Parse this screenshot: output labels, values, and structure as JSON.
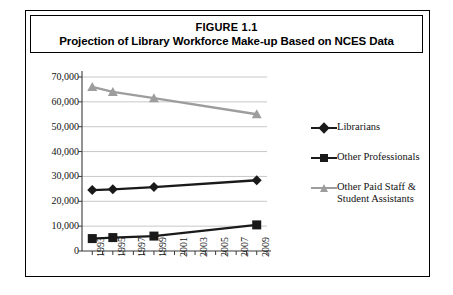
{
  "figure": {
    "title_line1": "FIGURE 1.1",
    "title_line2": "Projection of Library Workforce Make-up Based on NCES Data"
  },
  "chart_data": {
    "type": "line",
    "title": "Projection of Library Workforce Make-up Based on NCES Data",
    "xlabel": "",
    "ylabel": "",
    "ylim": [
      0,
      70000
    ],
    "yticks": [
      "0",
      "10,000",
      "20,000",
      "30,000",
      "40,000",
      "50,000",
      "60,000",
      "70,000"
    ],
    "ytick_values": [
      0,
      10000,
      20000,
      30000,
      40000,
      50000,
      60000,
      70000
    ],
    "xticks": [
      "1993",
      "1995",
      "1997",
      "1999",
      "2001",
      "2003",
      "2005",
      "2007",
      "2009"
    ],
    "xtick_values": [
      1993,
      1995,
      1997,
      1999,
      2001,
      2003,
      2005,
      2007,
      2009
    ],
    "xlim": [
      1992,
      2010
    ],
    "grid": "horizontal",
    "legend_position": "right",
    "series": [
      {
        "name": "Librarians",
        "color": "#1a1a1a",
        "marker": "diamond",
        "x": [
          1993,
          1995,
          1999,
          2009
        ],
        "values": [
          24500,
          24800,
          25700,
          28500
        ]
      },
      {
        "name": "Other Professionals",
        "color": "#1a1a1a",
        "marker": "square",
        "x": [
          1993,
          1995,
          1999,
          2009
        ],
        "values": [
          5000,
          5400,
          6000,
          10500
        ]
      },
      {
        "name": "Other Paid Staff & Student Assistants",
        "color": "#9d9d9d",
        "marker": "triangle",
        "x": [
          1993,
          1995,
          1999,
          2009
        ],
        "values": [
          66000,
          64000,
          61500,
          55000
        ]
      }
    ]
  },
  "legend": {
    "items": [
      {
        "label": "Librarians"
      },
      {
        "label": "Other Professionals"
      },
      {
        "label": "Other Paid Staff &"
      },
      {
        "label": "Student Assistants"
      }
    ]
  }
}
